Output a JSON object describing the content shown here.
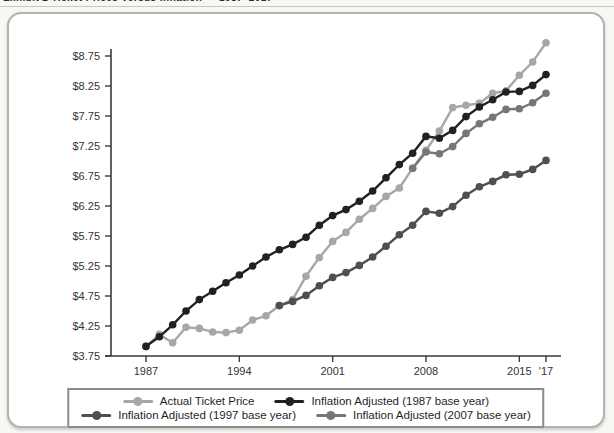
{
  "page": {
    "clipped_header": "Exhibit 2   Ticket Prices Versus Inflation — 1987–2017"
  },
  "chart_data": {
    "type": "line",
    "title": "Ticket Prices Versus Inflation — 1987–2017",
    "xlabel": "",
    "ylabel": "",
    "x_range": [
      1987,
      2017
    ],
    "ylim": [
      3.75,
      8.75
    ],
    "ytick_step": 0.5,
    "ytick_labels": [
      "$3.75",
      "$4.25",
      "$4.75",
      "$5.25",
      "$5.75",
      "$6.25",
      "$6.75",
      "$7.25",
      "$7.75",
      "$8.25",
      "$8.75"
    ],
    "xtick_years": [
      1987,
      1994,
      2001,
      2008,
      2015,
      2017
    ],
    "xtick_labels": [
      "1987",
      "1994",
      "2001",
      "2008",
      "2015",
      "'17"
    ],
    "grid": false,
    "axis_color": "#3a3a3a",
    "series": [
      {
        "name": "Actual Ticket Price",
        "color": "#a7a7a7",
        "start_year": 1987,
        "values": [
          3.91,
          4.11,
          3.97,
          4.23,
          4.21,
          4.15,
          4.14,
          4.18,
          4.35,
          4.42,
          4.59,
          4.69,
          5.08,
          5.39,
          5.66,
          5.81,
          6.03,
          6.21,
          6.41,
          6.55,
          6.88,
          7.18,
          7.5,
          7.89,
          7.93,
          7.96,
          8.13,
          8.17,
          8.43,
          8.65,
          8.97
        ]
      },
      {
        "name": "Inflation Adjusted (1987 base year)",
        "color": "#212121",
        "start_year": 1987,
        "values": [
          3.91,
          4.07,
          4.27,
          4.5,
          4.69,
          4.83,
          4.97,
          5.1,
          5.25,
          5.4,
          5.52,
          5.61,
          5.73,
          5.93,
          6.09,
          6.19,
          6.33,
          6.5,
          6.72,
          6.94,
          7.13,
          7.41,
          7.38,
          7.51,
          7.74,
          7.9,
          8.02,
          8.15,
          8.16,
          8.26,
          8.44
        ]
      },
      {
        "name": "Inflation Adjusted (1997 base year)",
        "color": "#4f4f4f",
        "start_year": 1997,
        "values": [
          4.59,
          4.66,
          4.76,
          4.92,
          5.06,
          5.14,
          5.26,
          5.4,
          5.58,
          5.77,
          5.93,
          6.16,
          6.13,
          6.24,
          6.43,
          6.57,
          6.66,
          6.77,
          6.78,
          6.86,
          7.01
        ]
      },
      {
        "name": "Inflation Adjusted (2007 base year)",
        "color": "#767676",
        "start_year": 2007,
        "values": [
          6.88,
          7.15,
          7.12,
          7.24,
          7.46,
          7.62,
          7.73,
          7.86,
          7.87,
          7.97,
          8.13
        ]
      }
    ],
    "legend": {
      "position": "bottom",
      "rows": [
        [
          0,
          1
        ],
        [
          2,
          3
        ]
      ]
    }
  }
}
